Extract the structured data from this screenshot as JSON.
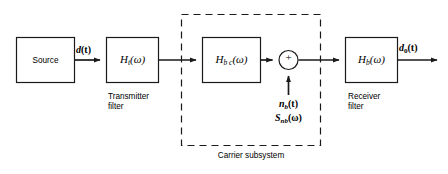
{
  "figure": {
    "type": "block-diagram",
    "background": "#ffffff",
    "line_color": "#1a1a1a"
  },
  "blocks": {
    "source": {
      "label": "Source"
    },
    "transmitter_filter": {
      "symbol_main": "H",
      "symbol_sub": "t",
      "symbol_arg": "(ω)",
      "caption_line1": "Transmitter",
      "caption_line2": "filter"
    },
    "channel_filter": {
      "symbol_main": "H",
      "symbol_sub": "b c",
      "symbol_arg": "(ω)"
    },
    "receiver_filter": {
      "symbol_main": "H",
      "symbol_sub": "b",
      "symbol_arg": "(ω)",
      "caption_line1": "Receiver",
      "caption_line2": "filter"
    },
    "summing_junction": {
      "sign": "+"
    }
  },
  "signals": {
    "source_output": {
      "main": "d",
      "arg": "(t)"
    },
    "system_output": {
      "main": "d",
      "sub": "0",
      "arg": "(t)"
    },
    "noise_time": {
      "main": "n",
      "sub": "b",
      "arg": "(t)"
    },
    "noise_spectrum": {
      "main": "S",
      "sub": "nb",
      "arg": "(ω)"
    }
  },
  "annotations": {
    "dashed_region_caption": "Carrier subsystem"
  }
}
